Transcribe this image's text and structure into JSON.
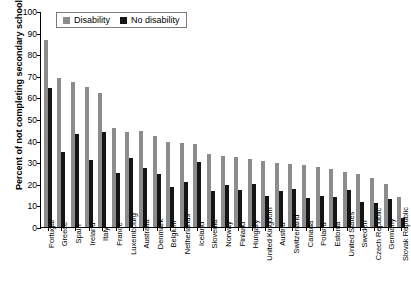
{
  "chart_data": {
    "type": "bar",
    "title": "",
    "xlabel": "",
    "ylabel": "Percent of not completing secondary school",
    "ylim": [
      0,
      100
    ],
    "yticks": [
      0,
      10,
      20,
      30,
      40,
      50,
      60,
      70,
      80,
      90,
      100
    ],
    "grid": false,
    "legend_position": "top-left",
    "categories": [
      "Portugal",
      "Greece",
      "Spain",
      "Ireland",
      "Italy",
      "France",
      "Luxembourg",
      "Australia",
      "Denmark",
      "Belgium",
      "Netherlands",
      "Iceland",
      "Slovenia",
      "Norway",
      "Finland",
      "Hungary",
      "United Kingdom",
      "Austria",
      "Switzerland",
      "Canada",
      "Poland",
      "Estonia",
      "United States",
      "Sweden",
      "Czech Republic",
      "Germany",
      "Slovak Republic"
    ],
    "series": [
      {
        "name": "Disability",
        "color": "#8c8c8c",
        "values": [
          86.5,
          69.0,
          67.0,
          65.0,
          62.0,
          46.0,
          44.0,
          44.5,
          42.0,
          39.5,
          39.0,
          38.5,
          34.0,
          33.0,
          32.5,
          31.5,
          30.5,
          29.5,
          29.0,
          28.5,
          28.0,
          27.0,
          25.5,
          24.5,
          22.5,
          20.0,
          14.0
        ]
      },
      {
        "name": "No disability",
        "color": "#151515",
        "values": [
          64.5,
          34.5,
          43.0,
          31.0,
          44.0,
          25.0,
          32.0,
          27.5,
          24.5,
          18.5,
          21.0,
          30.0,
          16.5,
          19.5,
          17.0,
          20.0,
          14.5,
          16.5,
          17.5,
          13.5,
          14.5,
          14.0,
          17.0,
          11.5,
          11.0,
          13.0,
          4.0
        ]
      }
    ]
  },
  "legend": {
    "items": [
      {
        "label": "Disability"
      },
      {
        "label": "No disability"
      }
    ]
  }
}
